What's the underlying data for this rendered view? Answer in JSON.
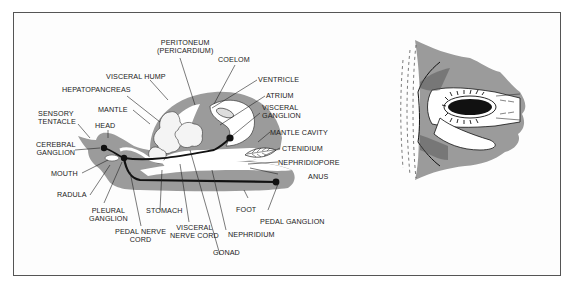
{
  "figure": {
    "left_panel": {
      "title": "Generalized mollusk anatomy (longitudinal section)",
      "labels": {
        "peritoneum": [
          "PERITONEUM",
          "(PERICARDIUM)"
        ],
        "coelom": "COELOM",
        "visceral_hump": "VISCERAL  HUMP",
        "hepatopancreas": "HEPATOPANCREAS",
        "ventricle": "VENTRICLE",
        "atrium": "ATRIUM",
        "visceral_ganglion": [
          "VISCERAL",
          "GANGLION"
        ],
        "mantle": "MANTLE",
        "sensory_tentacle": [
          "SENSORY",
          "TENTACLE"
        ],
        "head": "HEAD",
        "mantle_cavity": "MANTLE  CAVITY",
        "cerebral_ganglion": [
          "CEREBRAL",
          "GANGLION"
        ],
        "ctenidium": "CTENIDIUM",
        "nephridiopore": "NEPHRIDIOPORE",
        "mouth": "MOUTH",
        "anus": "ANUS",
        "radula": "RADULA",
        "foot": "FOOT",
        "pedal_ganglion": "PEDAL  GANGLION",
        "pleural_ganglion": [
          "PLEURAL",
          "GANGLION"
        ],
        "stomach": "STOMACH",
        "pedal_nerve_cord": [
          "PEDAL  NERVE",
          "CORD"
        ],
        "visceral_nerve_cord": [
          "VISCERAL",
          "NERVE  CORD"
        ],
        "nephridium": "NEPHRIDIUM",
        "gonad": "GONAD"
      }
    },
    "right_panel": {
      "description": "Cross-section detail of ctenidium within mantle"
    },
    "colors": {
      "tissue_fill": "#9b9b9b",
      "line": "#111111",
      "background": "#ffffff",
      "frame": "#555555"
    }
  }
}
